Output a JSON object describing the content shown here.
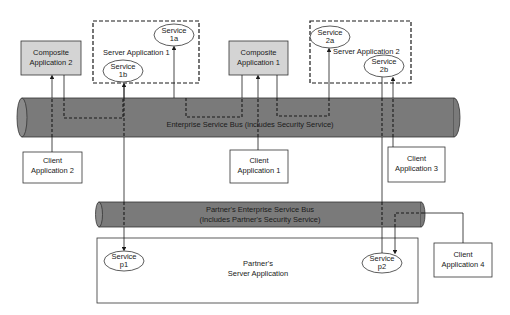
{
  "diagram": {
    "composite_apps": [
      {
        "id": "composite-2",
        "line1": "Composite",
        "line2": "Application 2"
      },
      {
        "id": "composite-1",
        "line1": "Composite",
        "line2": "Application 1"
      }
    ],
    "server_apps": [
      {
        "id": "server-1",
        "label": "Server Application 1"
      },
      {
        "id": "server-2",
        "label": "Server Application 2"
      }
    ],
    "services": [
      {
        "id": "1a",
        "line1": "Service",
        "line2": "1a"
      },
      {
        "id": "1b",
        "line1": "Service",
        "line2": "1b"
      },
      {
        "id": "2a",
        "line1": "Service",
        "line2": "2a"
      },
      {
        "id": "2b",
        "line1": "Service",
        "line2": "2b"
      },
      {
        "id": "p1",
        "line1": "Service",
        "line2": "p1"
      },
      {
        "id": "p2",
        "line1": "Service",
        "line2": "p2"
      }
    ],
    "esb": {
      "label": "Enterprise Service Bus (includes Security Service)"
    },
    "partner_esb": {
      "line1": "Partner's Enterprise Service Bus",
      "line2": "(Includes Partner's Security Service)"
    },
    "partner_server": {
      "line1": "Partner's",
      "line2": "Server Application"
    },
    "clients": [
      {
        "id": "client-1",
        "line1": "Client",
        "line2": "Application 1"
      },
      {
        "id": "client-2",
        "line1": "Client",
        "line2": "Application 2"
      },
      {
        "id": "client-3",
        "line1": "Client",
        "line2": "Application 3"
      },
      {
        "id": "client-4",
        "line1": "Client",
        "line2": "Application 4"
      }
    ],
    "colors": {
      "bus_fill": "#7a7a7a",
      "composite_fill": "#d4d4d4",
      "stroke": "#1a1a1a"
    }
  }
}
